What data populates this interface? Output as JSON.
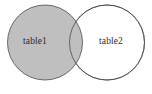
{
  "diagram": {
    "type": "venn",
    "title": "",
    "canvas": {
      "width": 152,
      "height": 94,
      "background": "#ffffff"
    },
    "sets": [
      {
        "id": "left",
        "label": "table1",
        "cx": 45,
        "cy": 42.5,
        "r": 37.5,
        "fill": "#bfbfbf",
        "stroke": "#4a4a4a",
        "label_x": 35,
        "label_y": 42
      },
      {
        "id": "right",
        "label": "table2",
        "cx": 107,
        "cy": 42.5,
        "r": 37.5,
        "fill": "#ffffff",
        "stroke": "#4a4a4a",
        "label_x": 111,
        "label_y": 42
      }
    ],
    "intersection": {
      "shaded": true,
      "fill": "#bfbfbf"
    },
    "stroke_width": 0.8
  }
}
